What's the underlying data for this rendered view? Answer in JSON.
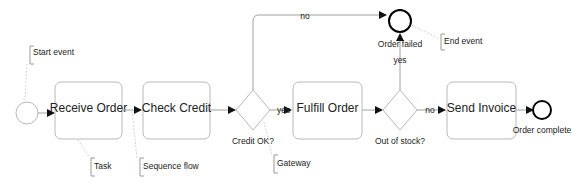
{
  "diagram": {
    "type": "BPMN process",
    "colors": {
      "line": "#a0a0a0",
      "shape_border": "#b8b8b8",
      "end_event": "#000000",
      "text": "#222222"
    },
    "start_event": {
      "label": ""
    },
    "tasks": [
      {
        "id": "receive",
        "label": "Receive Order"
      },
      {
        "id": "check",
        "label": "Check Credit"
      },
      {
        "id": "fulfill",
        "label": "Fulfill Order"
      },
      {
        "id": "invoice",
        "label": "Send Invoice"
      }
    ],
    "gateways": [
      {
        "id": "credit",
        "label": "Credit OK?"
      },
      {
        "id": "stock",
        "label": "Out of stock?"
      }
    ],
    "end_events": [
      {
        "id": "failed",
        "label": "Order failed"
      },
      {
        "id": "complete",
        "label": "Order complete"
      }
    ],
    "flow_labels": {
      "credit_no": "no",
      "credit_yes": "yes",
      "stock_yes": "yes",
      "stock_no": "no"
    },
    "annotations": {
      "start_event": "Start event",
      "task": "Task",
      "sequence_flow": "Sequence flow",
      "gateway": "Gateway",
      "end_event": "End event"
    }
  }
}
